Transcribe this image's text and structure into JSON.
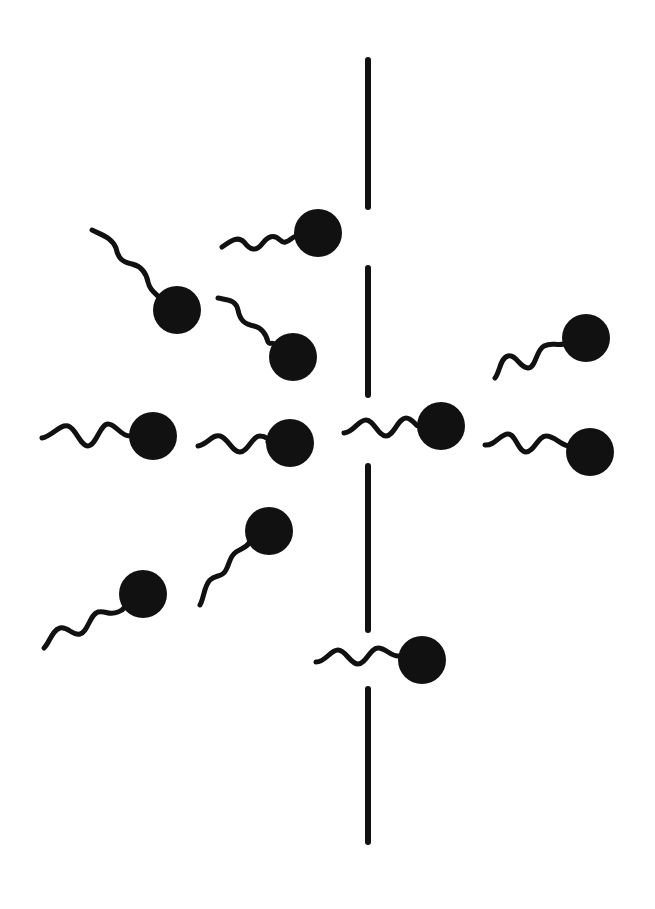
{
  "diagram": {
    "background": "#ffffff",
    "ink_color": "#111111",
    "barrier": {
      "x": 368,
      "segments": [
        {
          "y1": 60,
          "y2": 207
        },
        {
          "y1": 268,
          "y2": 395
        },
        {
          "y1": 466,
          "y2": 630
        },
        {
          "y1": 689,
          "y2": 842
        }
      ]
    },
    "cells": [
      {
        "id": "cell-1",
        "head": [
          318,
          233
        ],
        "tail": "M222,247 C232,240 238,236 244,242 C250,250 256,252 262,244 C268,236 274,234 280,240 C286,246 290,238 296,236"
      },
      {
        "id": "cell-2",
        "head": [
          177,
          310
        ],
        "tail": "M92,230 C104,236 112,238 116,248 C118,258 122,262 132,264 C140,266 146,272 148,282 C150,290 154,292 160,298"
      },
      {
        "id": "cell-3",
        "head": [
          293,
          357
        ],
        "tail": "M218,298 C228,300 236,300 238,310 C240,320 244,324 254,326 C262,328 266,334 268,342 C270,346 272,340 278,346"
      },
      {
        "id": "cell-4",
        "head": [
          153,
          436
        ],
        "tail": "M42,438 C52,436 60,424 68,426 C76,428 80,446 88,446 C96,446 100,424 108,424 C116,424 120,436 130,436"
      },
      {
        "id": "cell-5",
        "head": [
          290,
          443
        ],
        "tail": "M198,446 C208,444 212,434 220,436 C228,438 232,452 240,452 C248,452 252,436 260,436 C266,436 270,440 268,442"
      },
      {
        "id": "cell-6",
        "head": [
          441,
          426
        ],
        "tail": "M344,433 C354,432 358,420 366,420 C374,420 378,436 386,436 C394,436 398,418 406,418 C412,418 416,426 418,426"
      },
      {
        "id": "cell-7",
        "head": [
          586,
          338
        ],
        "tail": "M495,378 C500,372 500,358 508,356 C516,354 520,368 528,368 C536,368 536,350 544,346 C552,342 556,346 564,344"
      },
      {
        "id": "cell-8",
        "head": [
          590,
          452
        ],
        "tail": "M485,445 C495,446 500,434 508,434 C516,434 518,452 526,452 C534,452 538,436 546,436 C554,436 560,444 568,446"
      },
      {
        "id": "cell-9",
        "head": [
          143,
          594
        ],
        "tail": "M44,648 C50,642 52,630 60,628 C68,626 72,636 80,634 C88,632 90,614 98,612 C106,610 108,616 118,612 C124,610 126,606 124,604"
      },
      {
        "id": "cell-10",
        "head": [
          269,
          531
        ],
        "tail": "M200,605 C204,598 204,586 210,580 C216,574 222,578 226,570 C230,562 230,556 236,552 C242,548 246,548 250,542"
      },
      {
        "id": "cell-11",
        "head": [
          422,
          660
        ],
        "tail": "M316,662 C326,662 330,650 338,650 C346,650 350,664 358,664 C366,664 370,648 378,648 C386,648 390,656 398,656"
      }
    ],
    "head_radius": 24
  }
}
